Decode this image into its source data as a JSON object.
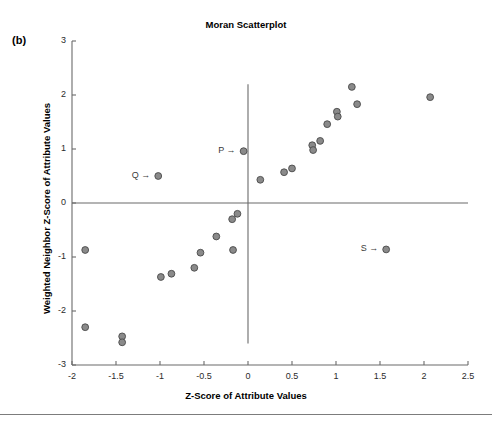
{
  "figure": {
    "panel_label": "(b)",
    "title": "Moran Scatterplot",
    "x_axis_title": "Z-Score of Attribute Values",
    "y_axis_title": "Weighted Neighbor Z-Score of Attribute Values",
    "axis_color": "#6b6b6b",
    "point_fill": "#8a8a8a",
    "point_stroke": "#4a4a4a",
    "background": "#ffffff"
  },
  "annotations": [
    {
      "name": "P",
      "text": "P →",
      "x": -0.05,
      "y": 0.96
    },
    {
      "name": "Q",
      "text": "Q →",
      "x": -1.02,
      "y": 0.5
    },
    {
      "name": "S",
      "text": "S →",
      "x": 1.57,
      "y": -0.86
    }
  ],
  "chart_data": {
    "type": "scatter",
    "title": "Moran Scatterplot",
    "xlabel": "Z-Score of Attribute Values",
    "ylabel": "Weighted Neighbor Z-Score of Attribute Values",
    "xlim": [
      -2,
      2.5
    ],
    "ylim": [
      -3,
      3
    ],
    "xticks": [
      -2,
      -1.5,
      -1,
      -0.5,
      0,
      0.5,
      1,
      1.5,
      2,
      2.5
    ],
    "xticklabels": [
      "-2",
      "-1.5",
      "-1",
      "-0.5",
      "0",
      "0.5",
      "1",
      "1.5",
      "2",
      "2.5"
    ],
    "yticks": [
      -3,
      -2,
      -1,
      0,
      1,
      2,
      3
    ],
    "yticklabels": [
      "-3",
      "-2",
      "-1",
      "0",
      "1",
      "2",
      "3"
    ],
    "grid": false,
    "legend": null,
    "reference_lines": [
      {
        "orientation": "horizontal",
        "value": 0
      },
      {
        "orientation": "vertical",
        "value": 0
      }
    ],
    "series": [
      {
        "name": "observations",
        "marker": "circle",
        "points": [
          {
            "x": -1.85,
            "y": -0.87
          },
          {
            "x": -1.85,
            "y": -2.3
          },
          {
            "x": -1.43,
            "y": -2.47
          },
          {
            "x": -1.43,
            "y": -2.58
          },
          {
            "x": -1.02,
            "y": 0.5,
            "label": "Q"
          },
          {
            "x": -0.99,
            "y": -1.37
          },
          {
            "x": -0.87,
            "y": -1.31
          },
          {
            "x": -0.61,
            "y": -1.2
          },
          {
            "x": -0.54,
            "y": -0.92
          },
          {
            "x": -0.36,
            "y": -0.62
          },
          {
            "x": -0.18,
            "y": -0.3
          },
          {
            "x": -0.17,
            "y": -0.87
          },
          {
            "x": -0.12,
            "y": -0.2
          },
          {
            "x": -0.05,
            "y": 0.96,
            "label": "P"
          },
          {
            "x": 0.14,
            "y": 0.43
          },
          {
            "x": 0.41,
            "y": 0.57
          },
          {
            "x": 0.5,
            "y": 0.64
          },
          {
            "x": 0.73,
            "y": 1.07
          },
          {
            "x": 0.74,
            "y": 0.98
          },
          {
            "x": 0.82,
            "y": 1.15
          },
          {
            "x": 0.9,
            "y": 1.46
          },
          {
            "x": 1.01,
            "y": 1.69
          },
          {
            "x": 1.02,
            "y": 1.6
          },
          {
            "x": 1.18,
            "y": 2.15
          },
          {
            "x": 1.24,
            "y": 1.83
          },
          {
            "x": 1.57,
            "y": -0.86,
            "label": "S"
          },
          {
            "x": 2.07,
            "y": 1.96
          }
        ]
      }
    ]
  }
}
